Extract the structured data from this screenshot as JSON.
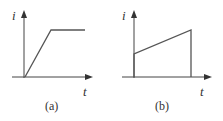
{
  "panels": [
    {
      "id": "a",
      "caption": "(a)",
      "y_label": "i",
      "x_label": "t",
      "description": "ramp rising from origin then constant",
      "waveform": [
        [
          25,
          77
        ],
        [
          51,
          30
        ],
        [
          85,
          30
        ]
      ]
    },
    {
      "id": "b",
      "caption": "(b)",
      "y_label": "i",
      "x_label": "t",
      "description": "step jump then linear rise then drop to zero",
      "waveform": [
        [
          134,
          77
        ],
        [
          134,
          54
        ],
        [
          191,
          30
        ],
        [
          191,
          77
        ]
      ]
    }
  ],
  "colors": {
    "axis": "#444444",
    "waveform": "#555555",
    "text": "#333333"
  }
}
